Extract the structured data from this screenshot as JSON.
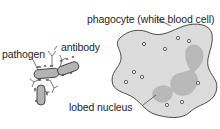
{
  "diagram": {
    "labels": {
      "phagocyte": "phagocyte (white blood cell)",
      "pathogen": "pathogen",
      "antibody": "antibody",
      "nucleus": "lobed nucleus"
    },
    "colors": {
      "outline": "#3a3a3a",
      "cell_fill": "#dcdcdc",
      "nucleus_fill": "#b9b9b9",
      "pathogen_fill": "#b3b3b3",
      "antibody_stroke": "#6a6a6a",
      "granule": "#3a3a3a",
      "text": "#231f20"
    }
  }
}
